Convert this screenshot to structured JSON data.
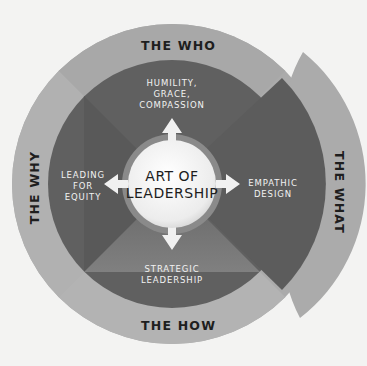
{
  "diagram": {
    "center": {
      "title_line1": "ART OF",
      "title_line2": "LEADERSHIP"
    },
    "outer_ring": {
      "top": "THE WHO",
      "left": "THE WHY",
      "right": "THE WHAT",
      "bottom": "THE HOW"
    },
    "inner_quadrants": {
      "top": [
        "HUMILITY,",
        "GRACE,",
        "COMPASSION"
      ],
      "left": [
        "LEADING",
        "FOR",
        "EQUITY"
      ],
      "right": [
        "EMPATHIC",
        "DESIGN"
      ],
      "bottom": [
        "STRATEGIC",
        "LEADERSHIP"
      ]
    },
    "arrows": [
      "up",
      "left",
      "right",
      "down"
    ],
    "colors": {
      "background": "#f3f3f2",
      "outer_ring": "#a9a9a9",
      "inner_dark": "#5f5f5f",
      "center_circle": "#f4f4f4",
      "inner_text": "#f2f2f2",
      "outer_text": "#1e1e1e"
    }
  }
}
